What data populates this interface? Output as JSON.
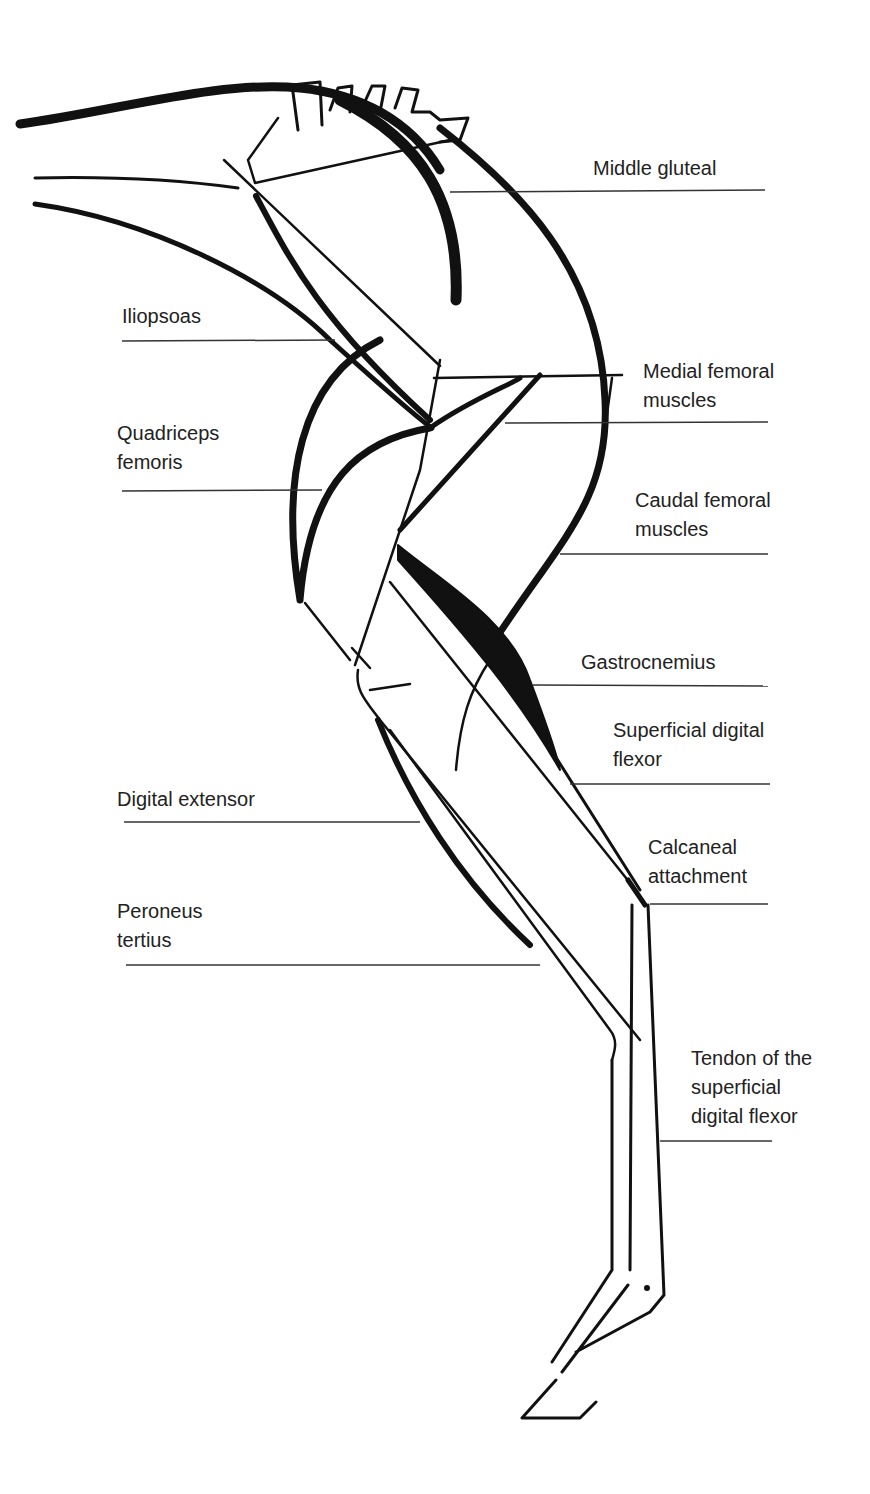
{
  "colors": {
    "ink": "#111111",
    "text": "#222222",
    "background": "#ffffff"
  },
  "labels": {
    "middle_gluteal": [
      "Middle gluteal"
    ],
    "iliopsoas": [
      "Iliopsoas"
    ],
    "medial_femoral": [
      "Medial femoral",
      "muscles"
    ],
    "quadriceps": [
      "Quadriceps",
      "femoris"
    ],
    "caudal_femoral": [
      "Caudal femoral",
      "muscles"
    ],
    "gastrocnemius": [
      "Gastrocnemius"
    ],
    "superficial_digital_flexor": [
      "Superficial digital",
      "flexor"
    ],
    "digital_extensor": [
      "Digital extensor"
    ],
    "calcaneal_attachment": [
      "Calcaneal",
      "attachment"
    ],
    "peroneus_tertius": [
      "Peroneus",
      "tertius"
    ],
    "sdf_tendon": [
      "Tendon of the",
      "superficial",
      "digital flexor"
    ]
  }
}
